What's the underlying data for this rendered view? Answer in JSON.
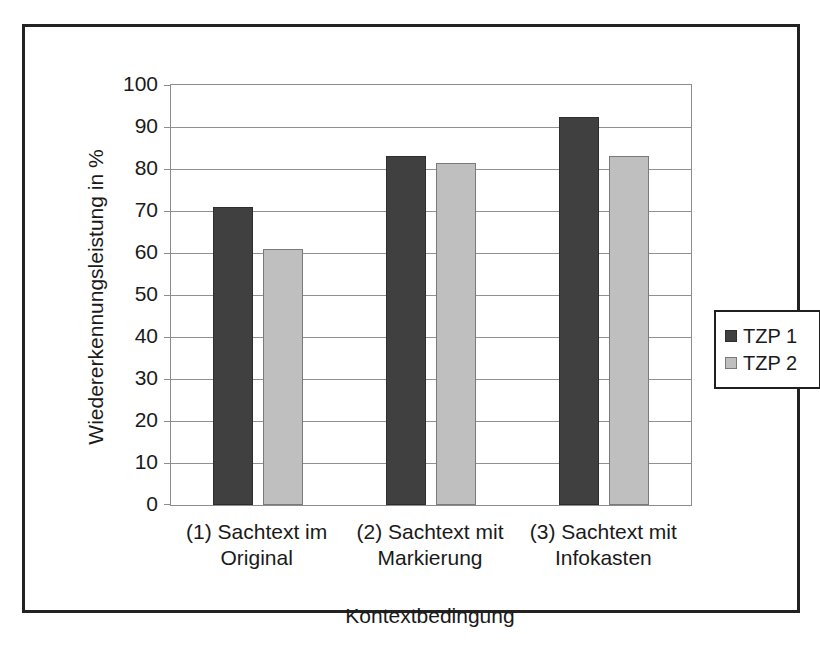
{
  "figure": {
    "background": "#ffffff",
    "border_color": "#222222"
  },
  "chart_data": {
    "type": "bar",
    "title": "",
    "categories": [
      "(1) Sachtext im Original",
      "(2) Sachtext mit Markierung",
      "(3) Sachtext mit Infokasten"
    ],
    "category_lines": [
      [
        "(1) Sachtext im",
        "Original"
      ],
      [
        "(2) Sachtext mit",
        "Markierung"
      ],
      [
        "(3) Sachtext mit",
        "Infokasten"
      ]
    ],
    "series": [
      {
        "name": "TZP 1",
        "values": [
          71,
          83,
          92.5
        ],
        "color": "#404040",
        "border_color": "#2e2e2e"
      },
      {
        "name": "TZP 2",
        "values": [
          61,
          81.5,
          83
        ],
        "color": "#bfbfbf",
        "border_color": "#7a7a7a"
      }
    ],
    "xlabel": "Kontextbedingung",
    "ylabel": "Wiedererkennungsleistung in %",
    "ylim": [
      0,
      100
    ],
    "yticks": [
      0,
      10,
      20,
      30,
      40,
      50,
      60,
      70,
      80,
      90,
      100
    ],
    "grid": true,
    "legend_position": "right",
    "legend": [
      "TZP 1",
      "TZP 2"
    ]
  },
  "style": {
    "grid_color": "#909090",
    "axis_color": "#8c8c8c",
    "text_color": "#1a1a1a"
  }
}
